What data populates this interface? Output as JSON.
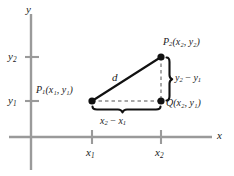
{
  "figure": {
    "colors": {
      "axis": "#9a9a9a",
      "hypotenuse": "#111111",
      "leg_dashed": "#8c8c8c",
      "brace": "#111111",
      "point": "#111111",
      "text": "#1a1a1a",
      "background": "#ffffff"
    }
  },
  "axes": {
    "x_label": "x",
    "y_label": "y",
    "x_ticks": [
      {
        "label_main": "x",
        "label_sub": "1"
      },
      {
        "label_main": "x",
        "label_sub": "2"
      }
    ],
    "y_ticks": [
      {
        "label_main": "y",
        "label_sub": "1"
      },
      {
        "label_main": "y",
        "label_sub": "2"
      }
    ]
  },
  "points": {
    "p1": {
      "name": "P",
      "name_sub": "1",
      "coords": "(x₁, y₁)",
      "coord_x_main": "x",
      "coord_x_sub": "1",
      "coord_y_main": "y",
      "coord_y_sub": "1"
    },
    "p2": {
      "name": "P",
      "name_sub": "2",
      "coords": "(x₂, y₂)",
      "coord_x_main": "x",
      "coord_x_sub": "2",
      "coord_y_main": "y",
      "coord_y_sub": "2"
    },
    "q": {
      "name": "Q",
      "name_sub": "",
      "coords": "(x₂, y₁)",
      "coord_x_main": "x",
      "coord_x_sub": "2",
      "coord_y_main": "y",
      "coord_y_sub": "1"
    }
  },
  "segments": {
    "hypotenuse_label": "d",
    "vertical_leg": {
      "term1_main": "y",
      "term1_sub": "2",
      "operator": "−",
      "term2_main": "y",
      "term2_sub": "1"
    },
    "horizontal_leg": {
      "term1_main": "x",
      "term1_sub": "2",
      "operator": "−",
      "term2_main": "x",
      "term2_sub": "1"
    }
  }
}
